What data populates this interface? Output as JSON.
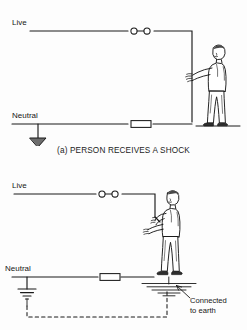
{
  "document": {
    "title": "Person receives a shock - electrical diagrams",
    "background_color": "#fdfdfd",
    "ink_color": "#1a1a1a"
  },
  "figures": [
    {
      "id": "a",
      "caption": "(a) PERSON RECEIVES A SHOCK",
      "labels": {
        "live": "Live",
        "neutral": "Neutral"
      },
      "symbols": {
        "live_device": "plug-connector-icon",
        "neutral_device": "fuse-icon",
        "earth": "earth-triangle-icon",
        "person": "standing-person-icon",
        "ground_line": "floor-line"
      },
      "description": "Live conductor runs right, down the wall; person touches it. Neutral returns to earth."
    },
    {
      "id": "b",
      "caption": "(b) PERSON RECEIVES A SHOCK",
      "labels": {
        "live": "Live",
        "neutral": "Neutral",
        "note_line1": "Connected",
        "note_line2": "to earth"
      },
      "symbols": {
        "live_device": "plug-connector-icon",
        "neutral_device": "fuse-icon",
        "earth": "earth-stacked-icon",
        "person": "standing-person-icon",
        "ground_hatch": "earth-ground-hatch-icon",
        "return_path": "dashed-earth-return-path",
        "pointer": "leader-arrow-icon"
      },
      "description": "Live conductor drops to the person's hand; current returns through the person's body to earth via the ground, shown by a dashed path back to the neutral earth electrode."
    }
  ]
}
